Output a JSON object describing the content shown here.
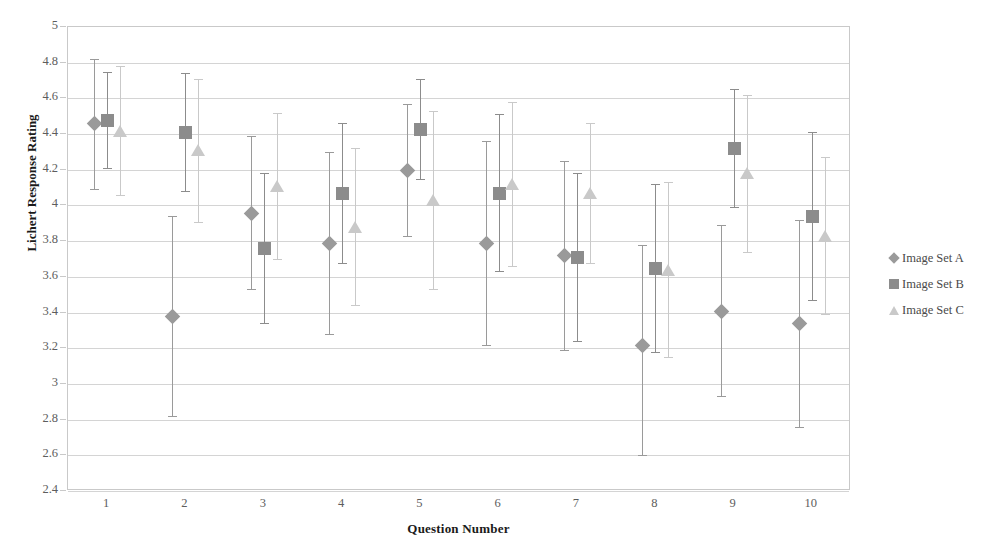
{
  "chart_data": {
    "type": "scatter",
    "title": "",
    "xlabel": "Question Number",
    "ylabel": "Lichert Response Rating",
    "categories": [
      "1",
      "2",
      "3",
      "4",
      "5",
      "6",
      "7",
      "8",
      "9",
      "10"
    ],
    "ylim": [
      2.4,
      5
    ],
    "ytick_step": 0.2,
    "yticks": [
      "5",
      "4.8",
      "4.6",
      "4.4",
      "4.2",
      "4",
      "3.8",
      "3.6",
      "3.4",
      "3.2",
      "3",
      "2.8",
      "2.6",
      "2.4"
    ],
    "grid": true,
    "legend_position": "right",
    "error_bars": true,
    "series": [
      {
        "name": "Image Set A",
        "marker": "diamond",
        "color": "#9a9a9a",
        "values": [
          4.46,
          3.38,
          3.96,
          3.79,
          4.2,
          3.79,
          3.72,
          3.22,
          3.41,
          3.34
        ],
        "err_low": [
          4.09,
          2.82,
          3.53,
          3.28,
          3.83,
          3.22,
          3.19,
          2.6,
          2.93,
          2.76
        ],
        "err_high": [
          4.82,
          3.94,
          4.39,
          4.3,
          4.57,
          4.36,
          4.25,
          3.78,
          3.89,
          3.92
        ]
      },
      {
        "name": "Image Set B",
        "marker": "square",
        "color": "#8c8c8c",
        "values": [
          4.48,
          4.41,
          3.76,
          4.07,
          4.43,
          4.07,
          3.71,
          3.65,
          4.32,
          3.94
        ],
        "err_low": [
          4.21,
          4.08,
          3.34,
          3.68,
          4.15,
          3.63,
          3.24,
          3.18,
          3.99,
          3.47
        ],
        "err_high": [
          4.75,
          4.74,
          4.18,
          4.46,
          4.71,
          4.51,
          4.18,
          4.12,
          4.65,
          4.41
        ]
      },
      {
        "name": "Image Set C",
        "marker": "triangle",
        "color": "#c9c9c9",
        "values": [
          4.42,
          4.31,
          4.11,
          3.88,
          4.03,
          4.12,
          4.07,
          3.64,
          4.18,
          3.83
        ],
        "err_low": [
          4.06,
          3.91,
          3.7,
          3.44,
          3.53,
          3.66,
          3.68,
          3.15,
          3.74,
          3.39
        ],
        "err_high": [
          4.78,
          4.71,
          4.52,
          4.32,
          4.53,
          4.58,
          4.46,
          4.13,
          4.62,
          4.27
        ]
      }
    ]
  }
}
